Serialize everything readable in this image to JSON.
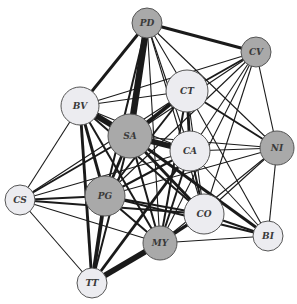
{
  "diagram": {
    "type": "network-graph",
    "colors": {
      "gray_node": "#a9a9a9",
      "light_node": "#ececf0",
      "stroke": "#555555",
      "edge": "#1a1a1a",
      "background": "#ffffff"
    },
    "nodes": [
      {
        "id": "PD",
        "label": "PD",
        "x": 147,
        "y": 23,
        "r": 15,
        "shade": "gray"
      },
      {
        "id": "CV",
        "label": "CV",
        "x": 256,
        "y": 52,
        "r": 15,
        "shade": "gray"
      },
      {
        "id": "BV",
        "label": "BV",
        "x": 80,
        "y": 106,
        "r": 19,
        "shade": "light"
      },
      {
        "id": "CT",
        "label": "CT",
        "x": 187,
        "y": 91,
        "r": 21,
        "shade": "light"
      },
      {
        "id": "SA",
        "label": "SA",
        "x": 130,
        "y": 136,
        "r": 22,
        "shade": "gray"
      },
      {
        "id": "CA",
        "label": "CA",
        "x": 190,
        "y": 151,
        "r": 20,
        "shade": "light"
      },
      {
        "id": "NI",
        "label": "NI",
        "x": 277,
        "y": 148,
        "r": 17,
        "shade": "gray"
      },
      {
        "id": "CS",
        "label": "CS",
        "x": 20,
        "y": 200,
        "r": 15,
        "shade": "light"
      },
      {
        "id": "PG",
        "label": "PG",
        "x": 105,
        "y": 196,
        "r": 20,
        "shade": "gray"
      },
      {
        "id": "CO",
        "label": "CO",
        "x": 204,
        "y": 214,
        "r": 20,
        "shade": "light"
      },
      {
        "id": "BI",
        "label": "BI",
        "x": 268,
        "y": 236,
        "r": 15,
        "shade": "light"
      },
      {
        "id": "MY",
        "label": "MY",
        "x": 160,
        "y": 243,
        "r": 17,
        "shade": "gray"
      },
      {
        "id": "TT",
        "label": "TT",
        "x": 92,
        "y": 283,
        "r": 15,
        "shade": "light"
      }
    ],
    "edges": [
      {
        "s": "PD",
        "t": "SA",
        "w": 7
      },
      {
        "s": "PD",
        "t": "BV",
        "w": 3
      },
      {
        "s": "PD",
        "t": "CV",
        "w": 3
      },
      {
        "s": "PD",
        "t": "CT",
        "w": 1
      },
      {
        "s": "PD",
        "t": "CA",
        "w": 1
      },
      {
        "s": "PD",
        "t": "NI",
        "w": 1
      },
      {
        "s": "PD",
        "t": "CO",
        "w": 1
      },
      {
        "s": "PD",
        "t": "PG",
        "w": 2
      },
      {
        "s": "PD",
        "t": "MY",
        "w": 1
      },
      {
        "s": "CV",
        "t": "CT",
        "w": 2
      },
      {
        "s": "CV",
        "t": "BV",
        "w": 1
      },
      {
        "s": "CV",
        "t": "SA",
        "w": 1
      },
      {
        "s": "CV",
        "t": "CA",
        "w": 1
      },
      {
        "s": "CV",
        "t": "NI",
        "w": 1
      },
      {
        "s": "CV",
        "t": "CO",
        "w": 1
      },
      {
        "s": "CV",
        "t": "MY",
        "w": 1
      },
      {
        "s": "CV",
        "t": "PG",
        "w": 1
      },
      {
        "s": "BV",
        "t": "SA",
        "w": 6
      },
      {
        "s": "BV",
        "t": "CT",
        "w": 1
      },
      {
        "s": "BV",
        "t": "CS",
        "w": 1
      },
      {
        "s": "BV",
        "t": "PG",
        "w": 3
      },
      {
        "s": "BV",
        "t": "TT",
        "w": 3
      },
      {
        "s": "BV",
        "t": "CO",
        "w": 2
      },
      {
        "s": "BV",
        "t": "MY",
        "w": 2
      },
      {
        "s": "BV",
        "t": "CA",
        "w": 1
      },
      {
        "s": "CT",
        "t": "SA",
        "w": 4
      },
      {
        "s": "CT",
        "t": "CA",
        "w": 3
      },
      {
        "s": "CT",
        "t": "NI",
        "w": 2
      },
      {
        "s": "CT",
        "t": "PG",
        "w": 2
      },
      {
        "s": "CT",
        "t": "CO",
        "w": 1
      },
      {
        "s": "CT",
        "t": "MY",
        "w": 2
      },
      {
        "s": "CT",
        "t": "BI",
        "w": 1
      },
      {
        "s": "CT",
        "t": "CS",
        "w": 1
      },
      {
        "s": "SA",
        "t": "CA",
        "w": 6
      },
      {
        "s": "SA",
        "t": "PG",
        "w": 3
      },
      {
        "s": "SA",
        "t": "CO",
        "w": 3
      },
      {
        "s": "SA",
        "t": "MY",
        "w": 2
      },
      {
        "s": "SA",
        "t": "TT",
        "w": 2
      },
      {
        "s": "SA",
        "t": "BI",
        "w": 3
      },
      {
        "s": "SA",
        "t": "CS",
        "w": 2
      },
      {
        "s": "SA",
        "t": "NI",
        "w": 1
      },
      {
        "s": "CA",
        "t": "NI",
        "w": 1
      },
      {
        "s": "CA",
        "t": "CO",
        "w": 2
      },
      {
        "s": "CA",
        "t": "MY",
        "w": 2
      },
      {
        "s": "CA",
        "t": "PG",
        "w": 2
      },
      {
        "s": "CA",
        "t": "BI",
        "w": 1
      },
      {
        "s": "CA",
        "t": "TT",
        "w": 3
      },
      {
        "s": "CA",
        "t": "CS",
        "w": 1
      },
      {
        "s": "NI",
        "t": "BI",
        "w": 1
      },
      {
        "s": "NI",
        "t": "CO",
        "w": 1
      },
      {
        "s": "NI",
        "t": "PG",
        "w": 1
      },
      {
        "s": "NI",
        "t": "MY",
        "w": 1
      },
      {
        "s": "CS",
        "t": "PG",
        "w": 2
      },
      {
        "s": "CS",
        "t": "TT",
        "w": 1
      },
      {
        "s": "CS",
        "t": "CO",
        "w": 2
      },
      {
        "s": "CS",
        "t": "MY",
        "w": 1
      },
      {
        "s": "PG",
        "t": "CO",
        "w": 2
      },
      {
        "s": "PG",
        "t": "MY",
        "w": 2
      },
      {
        "s": "PG",
        "t": "TT",
        "w": 4
      },
      {
        "s": "PG",
        "t": "BI",
        "w": 2
      },
      {
        "s": "CO",
        "t": "MY",
        "w": 3
      },
      {
        "s": "CO",
        "t": "BI",
        "w": 2
      },
      {
        "s": "CO",
        "t": "TT",
        "w": 2
      },
      {
        "s": "MY",
        "t": "TT",
        "w": 6
      },
      {
        "s": "MY",
        "t": "BI",
        "w": 1
      }
    ]
  }
}
